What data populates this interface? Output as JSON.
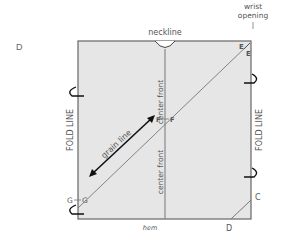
{
  "figure": {
    "corner_label": "D"
  },
  "labels": {
    "neckline": "neckline",
    "wrist_opening_line1": "wrist",
    "wrist_opening_line2": "opening",
    "fold_line_left": "FOLD LINE",
    "fold_line_right": "FOLD LINE",
    "center_front_top": "center front",
    "center_front_bottom": "center front",
    "grain_line": "grain line",
    "hem": "hem",
    "point_e1": "E",
    "point_e2": "E",
    "point_f1": "F",
    "point_f2": "F",
    "point_g1": "G",
    "point_g2": "G",
    "point_c": "C",
    "point_d": "D"
  },
  "colors": {
    "fill": "#e6e6e6",
    "stroke": "#666666",
    "arrow": "#111111"
  }
}
